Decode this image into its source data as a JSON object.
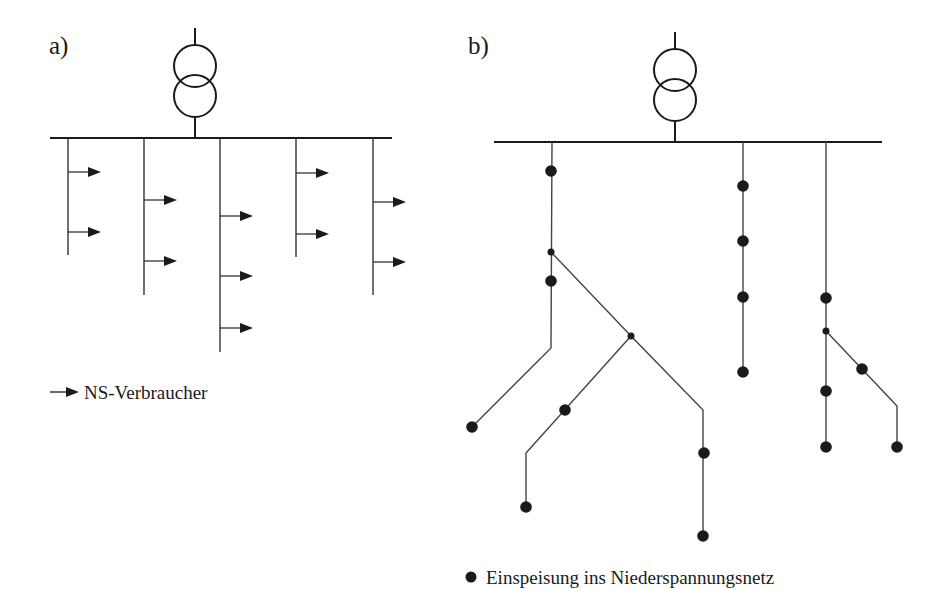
{
  "panels": [
    {
      "id": "a",
      "label": "a)",
      "legend": {
        "symbol": "arrow",
        "text": "NS-Verbraucher"
      },
      "transformer": {
        "x": 195,
        "top": 28,
        "bottom": 138
      },
      "bus": {
        "x1": 50,
        "x2": 392,
        "y": 138
      },
      "branches": [
        {
          "x": 68,
          "y_end": 255,
          "consumer_arrows_y": [
            172,
            232
          ]
        },
        {
          "x": 144,
          "y_end": 295,
          "consumer_arrows_y": [
            200,
            261
          ]
        },
        {
          "x": 220,
          "y_end": 352,
          "consumer_arrows_y": [
            216,
            276,
            328
          ]
        },
        {
          "x": 296,
          "y_end": 257,
          "consumer_arrows_y": [
            173,
            234
          ]
        },
        {
          "x": 373,
          "y_end": 295,
          "consumer_arrows_y": [
            202,
            262
          ]
        }
      ]
    },
    {
      "id": "b",
      "label": "b)",
      "legend": {
        "symbol": "dot",
        "text": "Einspeisung ins Niederspannungsnetz"
      },
      "transformer": {
        "x": 675,
        "top": 32,
        "bottom": 142
      },
      "bus": {
        "x1": 494,
        "x2": 882,
        "y": 142
      },
      "lines": [
        [
          [
            552,
            142
          ],
          [
            551,
            348
          ],
          [
            472,
            427
          ]
        ],
        [
          [
            551,
            252
          ],
          [
            631,
            336
          ],
          [
            703,
            410
          ],
          [
            703,
            536
          ]
        ],
        [
          [
            631,
            336
          ],
          [
            526,
            453
          ],
          [
            526,
            507
          ]
        ],
        [
          [
            743,
            142
          ],
          [
            743,
            372
          ]
        ],
        [
          [
            826,
            142
          ],
          [
            826,
            447
          ]
        ],
        [
          [
            826,
            331
          ],
          [
            897,
            406
          ],
          [
            897,
            447
          ]
        ]
      ],
      "junctions": [
        [
          551,
          252
        ],
        [
          631,
          336
        ],
        [
          826,
          331
        ]
      ],
      "feed_in_points": [
        [
          551,
          171
        ],
        [
          551,
          281
        ],
        [
          472,
          427
        ],
        [
          565,
          410
        ],
        [
          526,
          507
        ],
        [
          704,
          453
        ],
        [
          703,
          536
        ],
        [
          743,
          186
        ],
        [
          743,
          241
        ],
        [
          743,
          297
        ],
        [
          743,
          372
        ],
        [
          826,
          298
        ],
        [
          862,
          369
        ],
        [
          826,
          391
        ],
        [
          826,
          447
        ],
        [
          897,
          447
        ]
      ]
    }
  ]
}
